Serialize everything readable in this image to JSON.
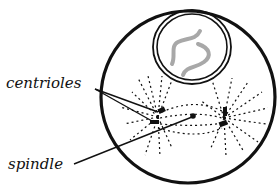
{
  "diagram": {
    "labels": {
      "centrioles": "centrioles",
      "spindle": "spindle"
    },
    "parts": [
      {
        "id": "cell-membrane",
        "shape": "circle"
      },
      {
        "id": "nucleus",
        "shape": "double-circle"
      },
      {
        "id": "chromatin",
        "shape": "squiggle"
      },
      {
        "id": "centriole-pair-left",
        "shape": "dashes"
      },
      {
        "id": "centriole-pair-right",
        "shape": "dashes"
      },
      {
        "id": "spindle-fibers",
        "shape": "dotted-lines"
      }
    ],
    "colors": {
      "ink": "#111111",
      "chromatin": "#a8a8a8",
      "background": "#ffffff"
    }
  }
}
